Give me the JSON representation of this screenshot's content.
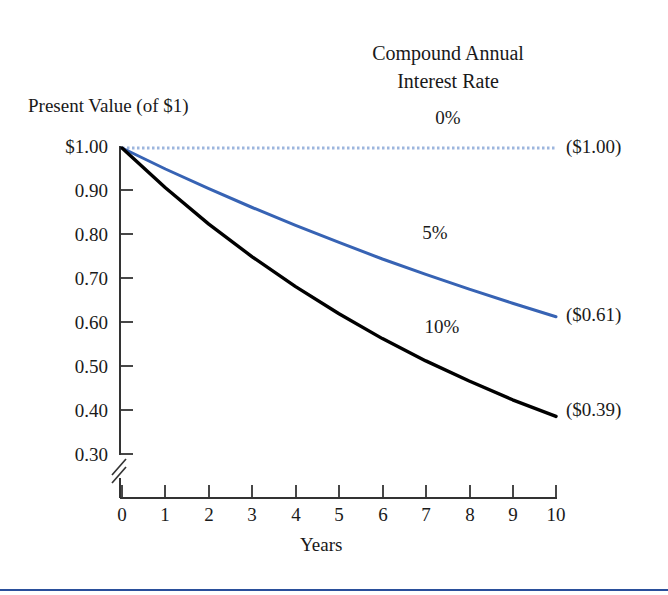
{
  "figure": {
    "background_color": "#ffffff",
    "bottom_rule_color": "#2a4f9b"
  },
  "legend": {
    "title_line1": "Compound Annual",
    "title_line2": "Interest Rate"
  },
  "axes": {
    "y_axis_title": "Present Value (of $1)",
    "x_axis_title": "Years",
    "y_tick_labels": [
      "$1.00",
      "0.90",
      "0.80",
      "0.70",
      "0.60",
      "0.50",
      "0.40",
      "0.30"
    ],
    "x_tick_labels": [
      "0",
      "1",
      "2",
      "3",
      "4",
      "5",
      "6",
      "7",
      "8",
      "9",
      "10"
    ],
    "axis_break_symbol": "//"
  },
  "series_labels": {
    "rate0": "0%",
    "rate5": "5%",
    "rate10": "10%"
  },
  "end_labels": {
    "rate0": "($1.00)",
    "rate5": "($0.61)",
    "rate10": "($0.39)"
  },
  "chart_data": {
    "type": "line",
    "title": "Compound Annual Interest Rate",
    "xlabel": "Years",
    "ylabel": "Present Value (of $1)",
    "x": [
      0,
      1,
      2,
      3,
      4,
      5,
      6,
      7,
      8,
      9,
      10
    ],
    "xlim": [
      0,
      10
    ],
    "ylim": [
      0.3,
      1.0
    ],
    "yticks": [
      0.3,
      0.4,
      0.5,
      0.6,
      0.7,
      0.8,
      0.9,
      1.0
    ],
    "ytick_labels": [
      "0.30",
      "0.40",
      "0.50",
      "0.60",
      "0.70",
      "0.80",
      "0.90",
      "$1.00"
    ],
    "y_axis_broken_below": 0.3,
    "grid": false,
    "legend_position": "inline-annotations",
    "series": [
      {
        "name": "0%",
        "color": "#9db6de",
        "style": "dotted",
        "end_label": "($1.00)",
        "values": [
          1.0,
          1.0,
          1.0,
          1.0,
          1.0,
          1.0,
          1.0,
          1.0,
          1.0,
          1.0,
          1.0
        ]
      },
      {
        "name": "5%",
        "color": "#3763b4",
        "style": "solid",
        "end_label": "($0.61)",
        "values": [
          1.0,
          0.952,
          0.907,
          0.864,
          0.823,
          0.784,
          0.746,
          0.711,
          0.677,
          0.645,
          0.614
        ]
      },
      {
        "name": "10%",
        "color": "#000000",
        "style": "solid",
        "end_label": "($0.39)",
        "values": [
          1.0,
          0.909,
          0.826,
          0.751,
          0.683,
          0.621,
          0.564,
          0.513,
          0.467,
          0.424,
          0.386
        ]
      }
    ],
    "annotations": [
      {
        "text": "0%",
        "x": 8.1,
        "y": 1.07
      },
      {
        "text": "5%",
        "x": 7.5,
        "y": 0.79
      },
      {
        "text": "10%",
        "x": 7.6,
        "y": 0.585
      }
    ]
  }
}
